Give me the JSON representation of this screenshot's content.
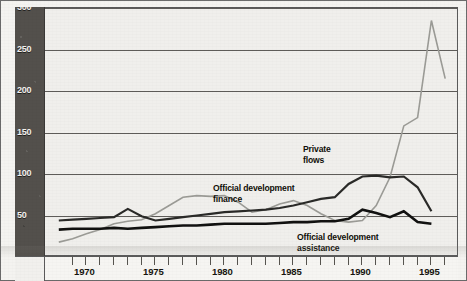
{
  "chart_data": {
    "type": "line",
    "title": "",
    "subtitle": "",
    "xlabel": "",
    "ylabel": "",
    "xlim": [
      1968,
      1998
    ],
    "ylim": [
      0,
      300
    ],
    "grid": true,
    "grid_axis": "y",
    "legend_position": "inline-annotations",
    "y_ticks": [
      50,
      100,
      150,
      200,
      250,
      300
    ],
    "y_tick_labels": [
      "50",
      "100",
      "150",
      "200",
      "250",
      "300"
    ],
    "x_ticks": [
      1970,
      1971,
      1972,
      1973,
      1974,
      1975,
      1976,
      1977,
      1978,
      1979,
      1980,
      1981,
      1982,
      1983,
      1984,
      1985,
      1986,
      1987,
      1988,
      1989,
      1990,
      1991,
      1992,
      1993,
      1994,
      1995,
      1996,
      1997
    ],
    "x_tick_labels_shown": [
      "1970",
      "1975",
      "1980",
      "1985",
      "1990",
      "1995"
    ],
    "annotations": [
      {
        "text": "Private\nflows",
        "x": 1989.0,
        "y": 140
      },
      {
        "text": "Official development\nfinance",
        "x": 1983.3,
        "y": 108
      },
      {
        "text": "Official development\nassistance",
        "x": 1989.6,
        "y": 26
      }
    ],
    "series": [
      {
        "name": "Private flows",
        "color": "#9b9b96",
        "width": 1.6,
        "x": [
          1969,
          1970,
          1971,
          1972,
          1973,
          1974,
          1975,
          1976,
          1977,
          1978,
          1979,
          1980,
          1981,
          1982,
          1983,
          1984,
          1985,
          1986,
          1987,
          1988,
          1989,
          1990,
          1991,
          1992,
          1993,
          1994,
          1995,
          1996,
          1997
        ],
        "values": [
          18,
          22,
          28,
          33,
          40,
          43,
          45,
          52,
          62,
          72,
          74,
          73,
          74,
          66,
          54,
          57,
          64,
          68,
          62,
          52,
          44,
          42,
          44,
          62,
          96,
          158,
          168,
          285,
          215
        ]
      },
      {
        "name": "Official development finance",
        "color": "#2a2a28",
        "width": 2.2,
        "x": [
          1969,
          1970,
          1971,
          1972,
          1973,
          1974,
          1975,
          1976,
          1977,
          1978,
          1979,
          1980,
          1981,
          1982,
          1983,
          1984,
          1985,
          1986,
          1987,
          1988,
          1989,
          1990,
          1991,
          1992,
          1993,
          1994,
          1995,
          1996
        ],
        "values": [
          44,
          45,
          46,
          47,
          48,
          58,
          49,
          44,
          46,
          48,
          50,
          52,
          54,
          55,
          56,
          57,
          59,
          62,
          66,
          70,
          72,
          88,
          97,
          98,
          96,
          97,
          84,
          55
        ]
      },
      {
        "name": "Official development assistance",
        "color": "#111110",
        "width": 2.6,
        "x": [
          1969,
          1970,
          1971,
          1972,
          1973,
          1974,
          1975,
          1976,
          1977,
          1978,
          1979,
          1980,
          1981,
          1982,
          1983,
          1984,
          1985,
          1986,
          1987,
          1988,
          1989,
          1990,
          1991,
          1992,
          1993,
          1994,
          1995,
          1996
        ],
        "values": [
          33,
          34,
          34,
          34,
          35,
          34,
          35,
          36,
          37,
          38,
          38,
          39,
          40,
          40,
          40,
          40,
          41,
          42,
          42,
          43,
          43,
          46,
          57,
          53,
          48,
          55,
          42,
          40
        ]
      }
    ]
  },
  "axes": {
    "y_band_labels": [
      "300",
      "250",
      "200",
      "150",
      "100",
      "50"
    ],
    "x_labels": [
      "1970",
      "1975",
      "1980",
      "1985",
      "1990",
      "1995"
    ]
  },
  "labels": {
    "private_flows": "Private\nflows",
    "official_development_finance": "Official development\nfinance",
    "official_development_assistance": "Official development\nassistance"
  }
}
